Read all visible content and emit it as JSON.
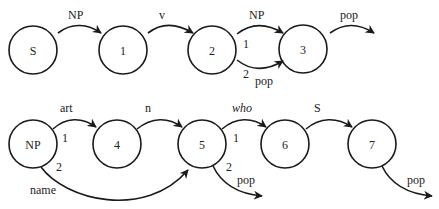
{
  "diagram": {
    "type": "augmented-transition-network",
    "networks": [
      {
        "name": "S-network",
        "nodes": [
          {
            "id": "S",
            "label": "S"
          },
          {
            "id": "1",
            "label": "1"
          },
          {
            "id": "2",
            "label": "2"
          },
          {
            "id": "3",
            "label": "3"
          }
        ],
        "arcs": [
          {
            "from": "S",
            "to": "1",
            "label": "NP"
          },
          {
            "from": "1",
            "to": "2",
            "label": "v"
          },
          {
            "from": "2",
            "to": "3",
            "label": "NP",
            "order": "1"
          },
          {
            "from": "2",
            "to": "3",
            "label": "pop",
            "order": "2"
          },
          {
            "from": "3",
            "to": null,
            "label": "pop"
          }
        ]
      },
      {
        "name": "NP-network",
        "nodes": [
          {
            "id": "NP",
            "label": "NP"
          },
          {
            "id": "4",
            "label": "4"
          },
          {
            "id": "5",
            "label": "5"
          },
          {
            "id": "6",
            "label": "6"
          },
          {
            "id": "7",
            "label": "7"
          }
        ],
        "arcs": [
          {
            "from": "NP",
            "to": "4",
            "label": "art",
            "order": "1"
          },
          {
            "from": "NP",
            "to": "5",
            "label": "name",
            "order": "2"
          },
          {
            "from": "4",
            "to": "5",
            "label": "n"
          },
          {
            "from": "5",
            "to": "6",
            "label": "who",
            "order": "1",
            "italic": true
          },
          {
            "from": "5",
            "to": null,
            "label": "pop",
            "order": "2"
          },
          {
            "from": "6",
            "to": "7",
            "label": "S"
          },
          {
            "from": "7",
            "to": null,
            "label": "pop"
          }
        ]
      }
    ]
  },
  "colors": {
    "stroke": "#1a1a1a",
    "text": "#222222",
    "background": "#ffffff"
  }
}
